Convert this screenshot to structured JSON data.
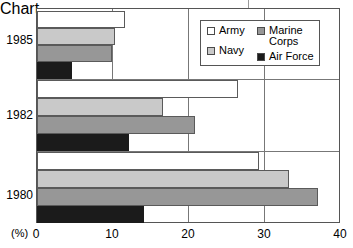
{
  "chart_data": {
    "type": "bar",
    "orientation": "horizontal",
    "title": "",
    "xlabel": "(%)",
    "ylabel": "",
    "xlim": [
      0,
      40
    ],
    "xticks": [
      "0",
      "10",
      "20",
      "30",
      "40"
    ],
    "grid": true,
    "legend_position": "top-right",
    "categories": [
      "1985",
      "1982",
      "1980"
    ],
    "series": [
      {
        "name": "Army",
        "color": "#ffffff",
        "values": [
          11.6,
          26.5,
          29.2
        ]
      },
      {
        "name": "Navy",
        "color": "#c9c9c9",
        "values": [
          10.3,
          16.6,
          33.2
        ]
      },
      {
        "name": "Marine Corps",
        "color": "#979797",
        "values": [
          9.9,
          20.8,
          37.0
        ]
      },
      {
        "name": "Air Force",
        "color": "#1b1b1b",
        "values": [
          4.6,
          12.1,
          14.1
        ]
      }
    ]
  },
  "axis": {
    "unit_label": "(%)",
    "ticks": [
      {
        "label": "0",
        "value": 0
      },
      {
        "label": "10",
        "value": 10
      },
      {
        "label": "20",
        "value": 20
      },
      {
        "label": "30",
        "value": 30
      },
      {
        "label": "40",
        "value": 40
      }
    ]
  },
  "groups": [
    {
      "label": "1985"
    },
    {
      "label": "1982"
    },
    {
      "label": "1980"
    }
  ],
  "legend": {
    "column_left": [
      {
        "label": "Army",
        "swatch": "#ffffff"
      },
      {
        "label": "Navy",
        "swatch": "#c9c9c9"
      }
    ],
    "column_right": [
      {
        "label": "Marine\nCorps",
        "swatch": "#979797"
      },
      {
        "label": "Air Force",
        "swatch": "#1b1b1b"
      }
    ]
  }
}
